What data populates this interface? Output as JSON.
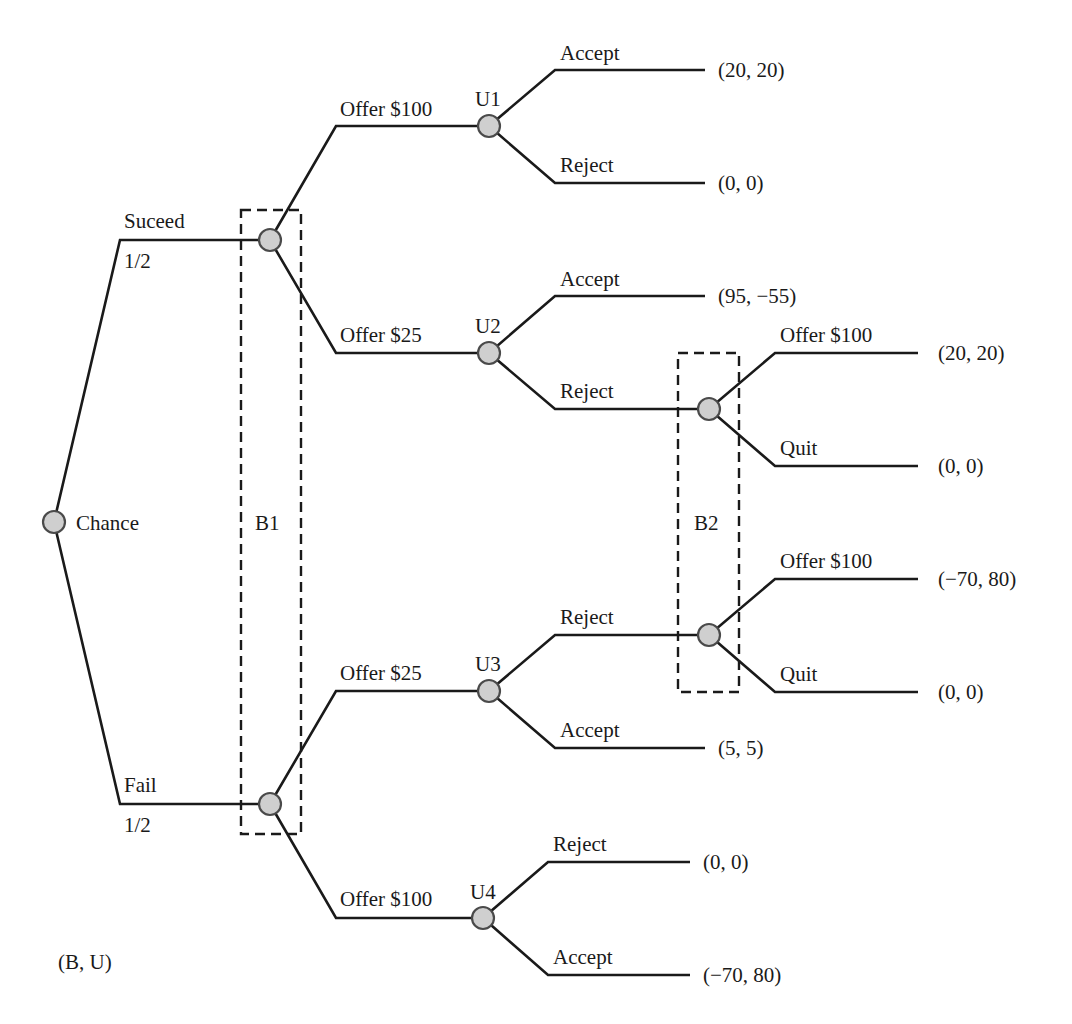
{
  "diagram": {
    "type": "extensive-form game tree",
    "payoff_legend": "(B, U)",
    "colors": {
      "line": "#1a1a1a",
      "node_fill": "#cfcfcf",
      "node_stroke": "#4a4a4a",
      "background": "#ffffff"
    },
    "root": {
      "label": "Chance",
      "branches": {
        "succeed": {
          "label": "Suceed",
          "probability": "1/2"
        },
        "fail": {
          "label": "Fail",
          "probability": "1/2"
        }
      }
    },
    "information_sets": {
      "b1": {
        "label": "B1"
      },
      "b2": {
        "label": "B2"
      }
    },
    "nodes": {
      "u1": {
        "label": "U1",
        "incoming": "Offer $100",
        "accept": {
          "label": "Accept",
          "payoff": "(20, 20)"
        },
        "reject": {
          "label": "Reject",
          "payoff": "(0, 0)"
        }
      },
      "u2": {
        "label": "U2",
        "incoming": "Offer $25",
        "accept": {
          "label": "Accept",
          "payoff": "(95, −55)"
        },
        "reject": {
          "label": "Reject"
        }
      },
      "b2_top": {
        "offer": {
          "label": "Offer $100",
          "payoff": "(20, 20)"
        },
        "quit": {
          "label": "Quit",
          "payoff": "(0, 0)"
        }
      },
      "b2_bottom": {
        "offer": {
          "label": "Offer $100",
          "payoff": "(−70, 80)"
        },
        "quit": {
          "label": "Quit",
          "payoff": "(0, 0)"
        }
      },
      "u3": {
        "label": "U3",
        "incoming": "Offer $25",
        "reject": {
          "label": "Reject"
        },
        "accept": {
          "label": "Accept",
          "payoff": "(5, 5)"
        }
      },
      "u4": {
        "label": "U4",
        "incoming": "Offer $100",
        "reject": {
          "label": "Reject",
          "payoff": "(0, 0)"
        },
        "accept": {
          "label": "Accept",
          "payoff": "(−70, 80)"
        }
      }
    }
  }
}
